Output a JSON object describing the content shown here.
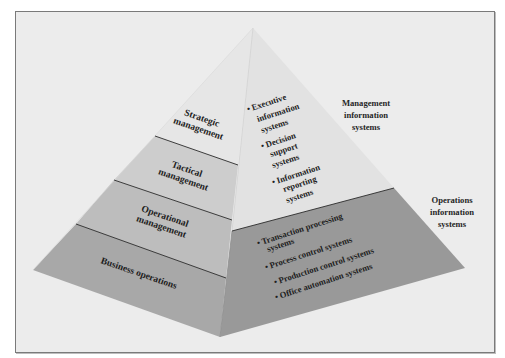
{
  "diagram": {
    "type": "pyramid",
    "left_face": {
      "levels": [
        {
          "label_lines": [
            "Strategic",
            "management"
          ],
          "color": "#e6e6e6"
        },
        {
          "label_lines": [
            "Tactical",
            "management"
          ],
          "color": "#cdcdcd"
        },
        {
          "label_lines": [
            "Operational",
            "management"
          ],
          "color": "#bdbdbd"
        },
        {
          "label_lines": [
            "Business operations"
          ],
          "color": "#a8a8a8"
        }
      ]
    },
    "right_face": {
      "upper": {
        "color": "#e2e2e2",
        "items": [
          {
            "lines": [
              "Executive",
              "information",
              "systems"
            ]
          },
          {
            "lines": [
              "Decision",
              "support",
              "systems"
            ]
          },
          {
            "lines": [
              "Information",
              "reporting",
              "systems"
            ]
          }
        ]
      },
      "lower": {
        "color": "#999999",
        "items": [
          {
            "lines": [
              "Transaction processing",
              "systems"
            ]
          },
          {
            "lines": [
              "Process control systems"
            ]
          },
          {
            "lines": [
              "Production control systems"
            ]
          },
          {
            "lines": [
              "Office automation systems"
            ]
          }
        ]
      }
    },
    "side_labels": {
      "management": [
        "Management",
        "information",
        "systems"
      ],
      "operations": [
        "Operations",
        "information",
        "systems"
      ]
    },
    "bullet": "•",
    "colors": {
      "background": "#ececec",
      "frame_border": "#7a7a7a",
      "divider": "#2a2a2a"
    }
  }
}
